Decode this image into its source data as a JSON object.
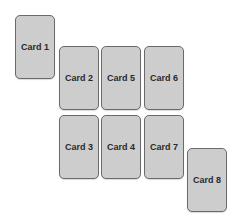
{
  "diagram": {
    "cards": [
      {
        "id": "card-1",
        "label": "Card 1",
        "x": 15,
        "y": 15
      },
      {
        "id": "card-2",
        "label": "Card 2",
        "x": 59,
        "y": 46
      },
      {
        "id": "card-5",
        "label": "Card 5",
        "x": 101,
        "y": 46
      },
      {
        "id": "card-6",
        "label": "Card 6",
        "x": 144,
        "y": 46
      },
      {
        "id": "card-3",
        "label": "Card 3",
        "x": 59,
        "y": 115
      },
      {
        "id": "card-4",
        "label": "Card 4",
        "x": 101,
        "y": 115
      },
      {
        "id": "card-7",
        "label": "Card 7",
        "x": 144,
        "y": 115
      },
      {
        "id": "card-8",
        "label": "Card 8",
        "x": 187,
        "y": 148
      }
    ],
    "colors": {
      "card_fill": "#cdcdcd",
      "card_border": "#6a6a6a",
      "label_text": "#2a2a2a",
      "background": "#ffffff"
    }
  }
}
